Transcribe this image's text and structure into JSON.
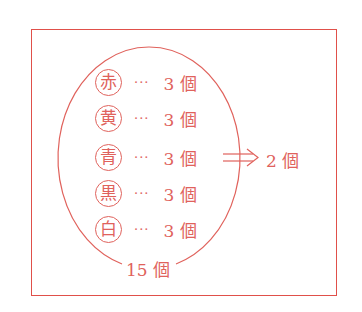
{
  "diagram": {
    "items": [
      {
        "color": "赤",
        "dots": "···",
        "count": "3 個"
      },
      {
        "color": "黄",
        "dots": "···",
        "count": "3 個"
      },
      {
        "color": "青",
        "dots": "···",
        "count": "3 個"
      },
      {
        "color": "黒",
        "dots": "···",
        "count": "3 個"
      },
      {
        "color": "白",
        "dots": "···",
        "count": "3 個"
      }
    ],
    "total": "15 個",
    "result": "2 個",
    "accent": "#e0625c"
  }
}
